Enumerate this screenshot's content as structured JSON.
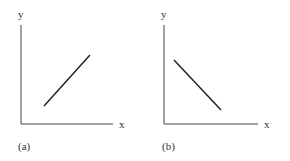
{
  "panels": [
    {
      "id": "a",
      "caption": "(a)",
      "x_label": "x",
      "y_label": "y",
      "relationship": "positive",
      "line": {
        "x1": 44,
        "y1": 106,
        "x2": 90,
        "y2": 55
      },
      "origin": {
        "x": 21,
        "y": 124
      },
      "y_top": 25,
      "x_right": 113
    },
    {
      "id": "b",
      "caption": "(b)",
      "x_label": "x",
      "y_label": "y",
      "relationship": "negative",
      "line": {
        "x1": 174,
        "y1": 60,
        "x2": 221,
        "y2": 110
      },
      "origin": {
        "x": 164,
        "y": 124
      },
      "y_top": 25,
      "x_right": 258
    }
  ],
  "colors": {
    "axis": "#444444",
    "line": "#222222",
    "text": "#333333"
  }
}
